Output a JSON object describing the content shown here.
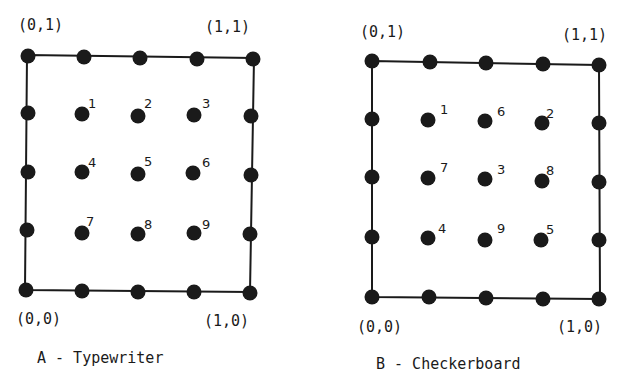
{
  "diagrams": [
    {
      "id": "A",
      "caption": "A - Typewriter",
      "corners": {
        "top_left": "(0,1)",
        "top_right": "(1,1)",
        "bottom_left": "(0,0)",
        "bottom_right": "(1,0)"
      },
      "interior_order": [
        [
          1,
          2,
          3
        ],
        [
          4,
          5,
          6
        ],
        [
          7,
          8,
          9
        ]
      ]
    },
    {
      "id": "B",
      "caption": "B - Checkerboard",
      "corners": {
        "top_left": "(0,1)",
        "top_right": "(1,1)",
        "bottom_left": "(0,0)",
        "bottom_right": "(1,0)"
      },
      "interior_order": [
        [
          1,
          6,
          2
        ],
        [
          7,
          3,
          8
        ],
        [
          4,
          9,
          5
        ]
      ]
    }
  ],
  "labels": {
    "a_tl": "(0,1)",
    "a_tr": "(1,1)",
    "a_bl": "(0,0)",
    "a_br": "(1,0)",
    "a_caption": "A - Typewriter",
    "a_n1": "1",
    "a_n2": "2",
    "a_n3": "3",
    "a_n4": "4",
    "a_n5": "5",
    "a_n6": "6",
    "a_n7": "7",
    "a_n8": "8",
    "a_n9": "9",
    "b_tl": "(0,1)",
    "b_tr": "(1,1)",
    "b_bl": "(0,0)",
    "b_br": "(1,0)",
    "b_caption": "B - Checkerboard",
    "b_n1": "1",
    "b_n6": "6",
    "b_n2": "2",
    "b_n7": "7",
    "b_n3": "3",
    "b_n8": "8",
    "b_n4": "4",
    "b_n9": "9",
    "b_n5": "5"
  },
  "colors": {
    "ink": "#1a1a1a",
    "background": "#ffffff"
  }
}
